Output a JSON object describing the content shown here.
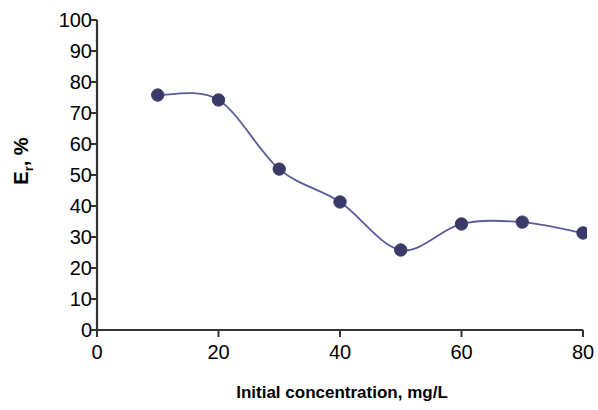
{
  "chart_data": {
    "type": "line",
    "title": "",
    "subtitle": "",
    "xlabel": "Initial concentration, mg/L",
    "ylabel": "E r , %",
    "ylabel_main": "E",
    "ylabel_sub": "r",
    "ylabel_tail": ", %",
    "x": [
      10,
      20,
      30,
      40,
      50,
      60,
      70,
      80
    ],
    "values": [
      75.8,
      74.2,
      51.9,
      41.3,
      25.8,
      34.2,
      34.8,
      31.3
    ],
    "series": [
      {
        "name": "Er",
        "values": [
          75.8,
          74.2,
          51.9,
          41.3,
          25.8,
          34.2,
          34.8,
          31.3
        ]
      }
    ],
    "xlim": [
      0,
      80
    ],
    "ylim": [
      0,
      100
    ],
    "xticks": [
      0,
      20,
      40,
      60,
      80
    ],
    "yticks": [
      0,
      10,
      20,
      30,
      40,
      50,
      60,
      70,
      80,
      90,
      100
    ],
    "xtick_labels": [
      "0",
      "20",
      "40",
      "60",
      "80"
    ],
    "ytick_labels": [
      "0",
      "10",
      "20",
      "30",
      "40",
      "50",
      "60",
      "70",
      "80",
      "90",
      "100"
    ],
    "grid": false,
    "legend": false,
    "legend_position": "none",
    "marker": "circle",
    "marker_color": "#3a3a68",
    "line_color": "#5a5a9a",
    "axis_color": "#333333",
    "background": "#ffffff"
  }
}
